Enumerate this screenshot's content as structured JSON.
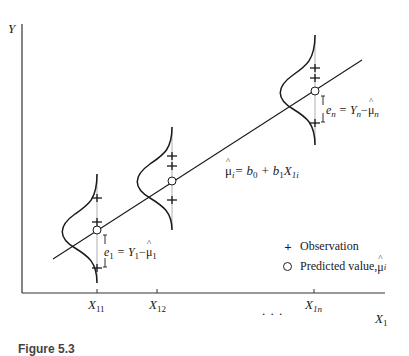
{
  "axes": {
    "y_label": "Y",
    "x_label": "X",
    "x_label_sub": "1"
  },
  "x_ticks": [
    {
      "label": "X",
      "sub": "11"
    },
    {
      "label": "X",
      "sub": "12"
    },
    {
      "label": "X",
      "sub": "1n"
    }
  ],
  "ellipsis": ". . .",
  "regression_equation": {
    "lhs": "μ",
    "lhs_sub": "i",
    "rhs": "= b",
    "b0_sub": "0",
    "plus": " + b",
    "b1_sub": "1",
    "x": "X",
    "x_sub": "1i"
  },
  "residual_labels": [
    {
      "e": "e",
      "e_sub": "1",
      "eq": " = Y",
      "y_sub": "1",
      "minus": "−",
      "mu": "μ",
      "mu_sub": "1"
    },
    {
      "e": "e",
      "e_sub": "n",
      "eq": " = Y",
      "y_sub": "n",
      "minus": "−",
      "mu": "μ",
      "mu_sub": "n"
    }
  ],
  "legend": {
    "observation_symbol": "+",
    "observation_label": "Observation",
    "predicted_label": "Predicted value, ",
    "predicted_mu": "μ",
    "predicted_sub": "i"
  },
  "caption": "Figure 5.3"
}
